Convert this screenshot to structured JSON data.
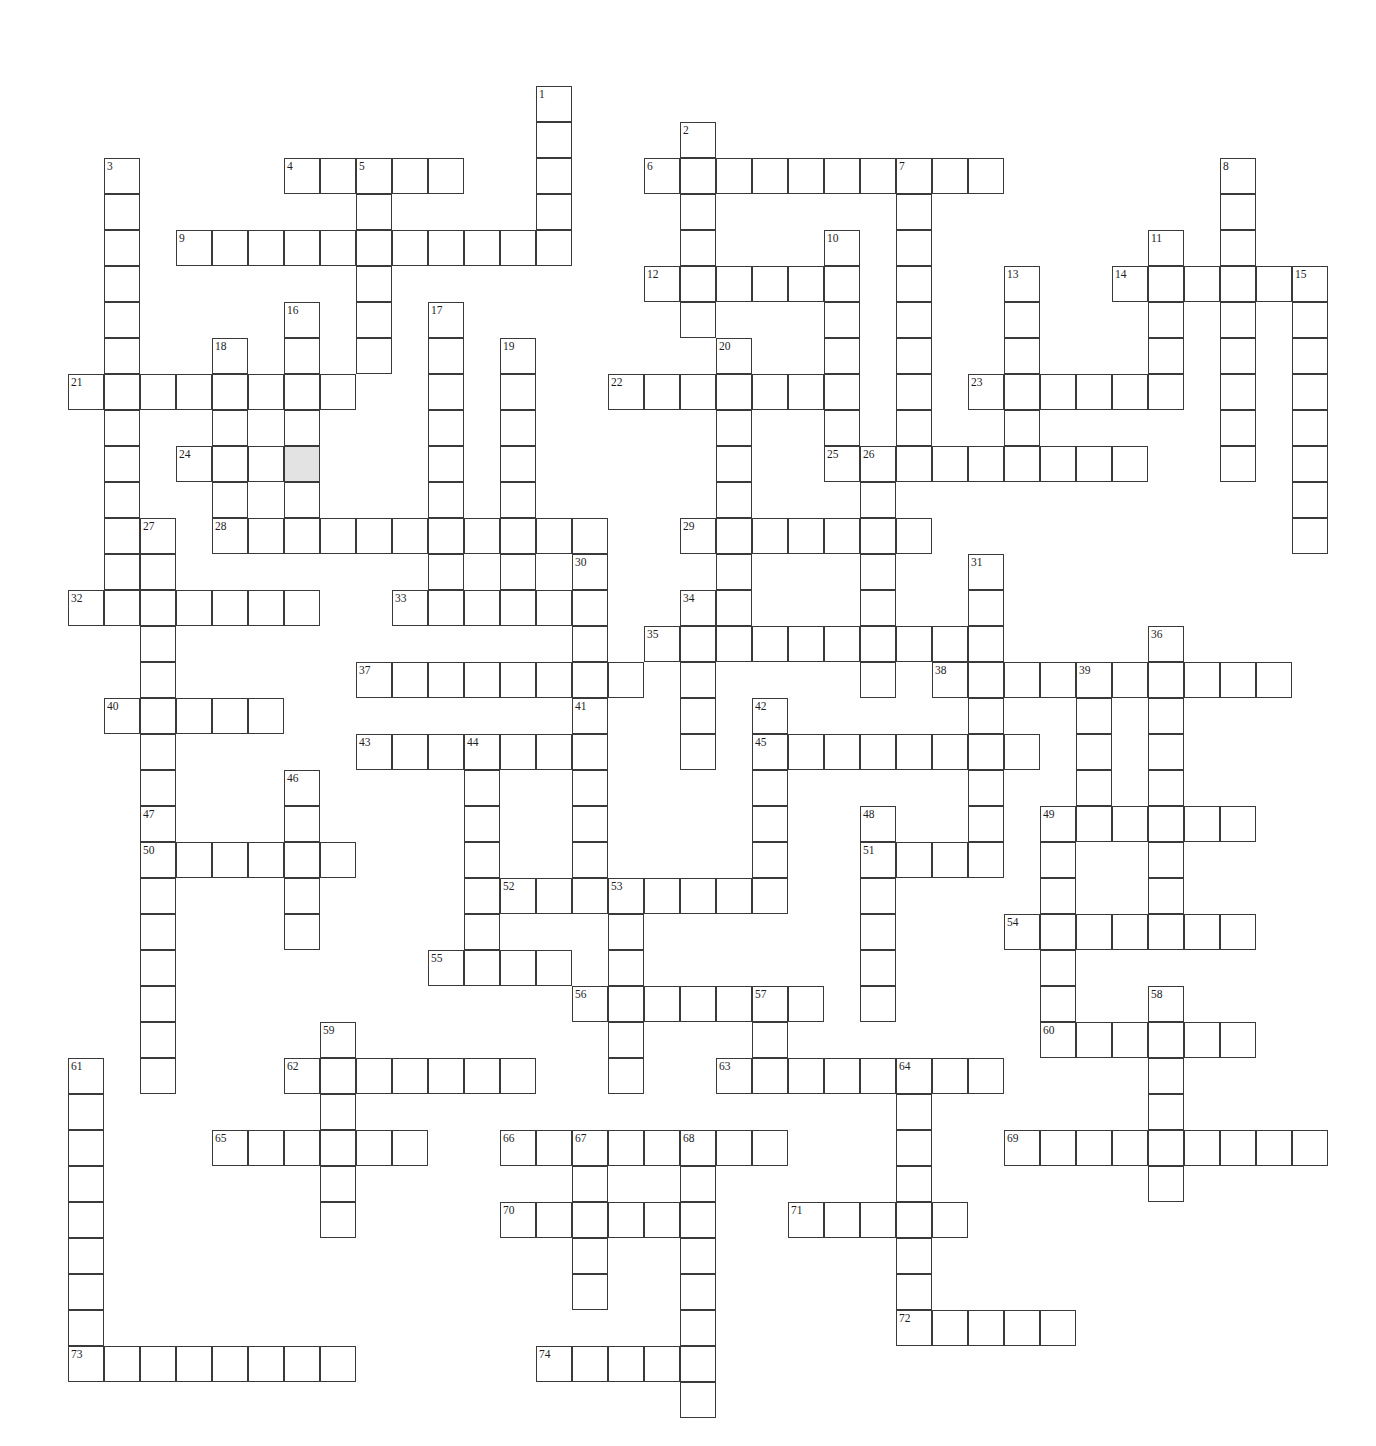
{
  "puzzle": {
    "title": "Crossword Puzzle Grid",
    "cell_size": 36,
    "origin_x": 68,
    "origin_y": 86,
    "cols": 36,
    "rows": 37,
    "grid_line_color": "#3a3a3a",
    "cell_fill_color": "#ffffff",
    "shaded_fill_color": "#e3e3e3",
    "number_color": "#1d1d1d",
    "shaded_cells": [
      [
        6,
        10
      ]
    ],
    "entries": [
      {
        "number": 1,
        "direction": "down",
        "col": 13,
        "row": 0,
        "length": 5
      },
      {
        "number": 2,
        "direction": "down",
        "col": 17,
        "row": 1,
        "length": 6
      },
      {
        "number": 3,
        "direction": "down",
        "col": 1,
        "row": 2,
        "length": 12
      },
      {
        "number": 4,
        "direction": "across",
        "col": 6,
        "row": 2,
        "length": 5
      },
      {
        "number": 5,
        "direction": "down",
        "col": 8,
        "row": 2,
        "length": 6
      },
      {
        "number": 6,
        "direction": "across",
        "col": 16,
        "row": 2,
        "length": 10
      },
      {
        "number": 7,
        "direction": "down",
        "col": 23,
        "row": 2,
        "length": 8
      },
      {
        "number": 8,
        "direction": "down",
        "col": 32,
        "row": 2,
        "length": 9
      },
      {
        "number": 9,
        "direction": "across",
        "col": 3,
        "row": 4,
        "length": 11
      },
      {
        "number": 10,
        "direction": "down",
        "col": 21,
        "row": 4,
        "length": 6
      },
      {
        "number": 11,
        "direction": "down",
        "col": 30,
        "row": 4,
        "length": 5
      },
      {
        "number": 12,
        "direction": "across",
        "col": 16,
        "row": 5,
        "length": 6
      },
      {
        "number": 13,
        "direction": "down",
        "col": 26,
        "row": 5,
        "length": 5
      },
      {
        "number": 14,
        "direction": "across",
        "col": 29,
        "row": 5,
        "length": 6
      },
      {
        "number": 15,
        "direction": "down",
        "col": 34,
        "row": 5,
        "length": 8
      },
      {
        "number": 16,
        "direction": "down",
        "col": 6,
        "row": 6,
        "length": 6
      },
      {
        "number": 17,
        "direction": "down",
        "col": 10,
        "row": 6,
        "length": 9
      },
      {
        "number": 18,
        "direction": "down",
        "col": 4,
        "row": 7,
        "length": 5
      },
      {
        "number": 19,
        "direction": "down",
        "col": 12,
        "row": 7,
        "length": 8
      },
      {
        "number": 20,
        "direction": "down",
        "col": 18,
        "row": 7,
        "length": 8
      },
      {
        "number": 21,
        "direction": "across",
        "col": 0,
        "row": 8,
        "length": 8
      },
      {
        "number": 22,
        "direction": "across",
        "col": 15,
        "row": 8,
        "length": 7
      },
      {
        "number": 23,
        "direction": "across",
        "col": 25,
        "row": 8,
        "length": 6
      },
      {
        "number": 24,
        "direction": "across",
        "col": 3,
        "row": 10,
        "length": 4
      },
      {
        "number": 25,
        "direction": "across",
        "col": 21,
        "row": 10,
        "length": 9
      },
      {
        "number": 26,
        "direction": "down",
        "col": 22,
        "row": 10,
        "length": 7
      },
      {
        "number": 27,
        "direction": "down",
        "col": 2,
        "row": 12,
        "length": 9
      },
      {
        "number": 28,
        "direction": "across",
        "col": 4,
        "row": 12,
        "length": 11
      },
      {
        "number": 29,
        "direction": "across",
        "col": 17,
        "row": 12,
        "length": 7
      },
      {
        "number": 30,
        "direction": "down",
        "col": 14,
        "row": 13,
        "length": 4
      },
      {
        "number": 31,
        "direction": "down",
        "col": 25,
        "row": 13,
        "length": 8
      },
      {
        "number": 32,
        "direction": "across",
        "col": 0,
        "row": 14,
        "length": 7
      },
      {
        "number": 33,
        "direction": "across",
        "col": 9,
        "row": 14,
        "length": 6
      },
      {
        "number": 34,
        "direction": "down",
        "col": 17,
        "row": 14,
        "length": 5
      },
      {
        "number": 35,
        "direction": "across",
        "col": 16,
        "row": 15,
        "length": 9
      },
      {
        "number": 36,
        "direction": "down",
        "col": 30,
        "row": 15,
        "length": 8
      },
      {
        "number": 37,
        "direction": "across",
        "col": 8,
        "row": 16,
        "length": 8
      },
      {
        "number": 38,
        "direction": "across",
        "col": 24,
        "row": 16,
        "length": 10
      },
      {
        "number": 39,
        "direction": "down",
        "col": 28,
        "row": 16,
        "length": 4
      },
      {
        "number": 40,
        "direction": "across",
        "col": 1,
        "row": 17,
        "length": 5
      },
      {
        "number": 41,
        "direction": "down",
        "col": 14,
        "row": 17,
        "length": 5
      },
      {
        "number": 42,
        "direction": "down",
        "col": 19,
        "row": 17,
        "length": 6
      },
      {
        "number": 43,
        "direction": "across",
        "col": 8,
        "row": 18,
        "length": 7
      },
      {
        "number": 44,
        "direction": "down",
        "col": 11,
        "row": 18,
        "length": 6
      },
      {
        "number": 45,
        "direction": "across",
        "col": 19,
        "row": 18,
        "length": 8
      },
      {
        "number": 46,
        "direction": "down",
        "col": 6,
        "row": 19,
        "length": 5
      },
      {
        "number": 47,
        "direction": "down",
        "col": 2,
        "row": 20,
        "length": 8
      },
      {
        "number": 48,
        "direction": "down",
        "col": 22,
        "row": 20,
        "length": 6
      },
      {
        "number": 49,
        "direction": "across",
        "col": 27,
        "row": 20,
        "length": 6
      },
      {
        "number": 50,
        "direction": "across",
        "col": 2,
        "row": 21,
        "length": 6
      },
      {
        "number": 51,
        "direction": "across",
        "col": 22,
        "row": 21,
        "length": 4
      },
      {
        "number": 52,
        "direction": "across",
        "col": 12,
        "row": 22,
        "length": 7
      },
      {
        "number": 53,
        "direction": "down",
        "col": 15,
        "row": 22,
        "length": 6
      },
      {
        "number": 54,
        "direction": "across",
        "col": 26,
        "row": 23,
        "length": 7
      },
      {
        "number": 55,
        "direction": "across",
        "col": 10,
        "row": 24,
        "length": 4
      },
      {
        "number": 56,
        "direction": "across",
        "col": 14,
        "row": 25,
        "length": 7
      },
      {
        "number": 57,
        "direction": "down",
        "col": 19,
        "row": 25,
        "length": 3
      },
      {
        "number": 58,
        "direction": "down",
        "col": 30,
        "row": 25,
        "length": 6
      },
      {
        "number": 59,
        "direction": "down",
        "col": 7,
        "row": 26,
        "length": 6
      },
      {
        "number": 60,
        "direction": "across",
        "col": 27,
        "row": 26,
        "length": 6
      },
      {
        "number": 61,
        "direction": "down",
        "col": 0,
        "row": 27,
        "length": 8
      },
      {
        "number": 62,
        "direction": "across",
        "col": 6,
        "row": 27,
        "length": 7
      },
      {
        "number": 63,
        "direction": "across",
        "col": 18,
        "row": 27,
        "length": 8
      },
      {
        "number": 64,
        "direction": "down",
        "col": 23,
        "row": 27,
        "length": 8
      },
      {
        "number": 65,
        "direction": "across",
        "col": 4,
        "row": 29,
        "length": 6
      },
      {
        "number": 66,
        "direction": "across",
        "col": 12,
        "row": 29,
        "length": 8
      },
      {
        "number": 67,
        "direction": "down",
        "col": 14,
        "row": 29,
        "length": 5
      },
      {
        "number": 68,
        "direction": "down",
        "col": 17,
        "row": 29,
        "length": 8
      },
      {
        "number": 69,
        "direction": "across",
        "col": 26,
        "row": 29,
        "length": 9
      },
      {
        "number": 70,
        "direction": "across",
        "col": 12,
        "row": 31,
        "length": 5
      },
      {
        "number": 71,
        "direction": "across",
        "col": 20,
        "row": 31,
        "length": 5
      },
      {
        "number": 72,
        "direction": "across",
        "col": 23,
        "row": 34,
        "length": 5
      },
      {
        "number": 73,
        "direction": "across",
        "col": 0,
        "row": 35,
        "length": 8
      },
      {
        "number": 74,
        "direction": "across",
        "col": 13,
        "row": 35,
        "length": 5
      }
    ],
    "extra_cells": [
      [
        1,
        3
      ],
      [
        1,
        4
      ],
      [
        1,
        5
      ],
      [
        1,
        6
      ],
      [
        1,
        7
      ],
      [
        1,
        8
      ],
      [
        1,
        9
      ],
      [
        1,
        10
      ],
      [
        1,
        11
      ],
      [
        1,
        12
      ],
      [
        1,
        13
      ],
      [
        13,
        1
      ],
      [
        13,
        2
      ],
      [
        13,
        3
      ],
      [
        13,
        4
      ],
      [
        17,
        2
      ],
      [
        17,
        3
      ],
      [
        17,
        4
      ],
      [
        17,
        5
      ],
      [
        17,
        6
      ],
      [
        8,
        3
      ],
      [
        8,
        4
      ],
      [
        8,
        5
      ],
      [
        8,
        6
      ],
      [
        8,
        7
      ],
      [
        23,
        3
      ],
      [
        23,
        4
      ],
      [
        23,
        5
      ],
      [
        23,
        6
      ],
      [
        23,
        7
      ],
      [
        23,
        8
      ],
      [
        23,
        9
      ],
      [
        32,
        3
      ],
      [
        32,
        4
      ],
      [
        32,
        5
      ],
      [
        32,
        6
      ],
      [
        32,
        7
      ],
      [
        32,
        8
      ],
      [
        32,
        9
      ],
      [
        32,
        10
      ],
      [
        21,
        5
      ],
      [
        21,
        6
      ],
      [
        21,
        7
      ],
      [
        21,
        8
      ],
      [
        21,
        9
      ],
      [
        30,
        5
      ],
      [
        30,
        6
      ],
      [
        30,
        7
      ],
      [
        30,
        8
      ],
      [
        26,
        6
      ],
      [
        26,
        7
      ],
      [
        26,
        8
      ],
      [
        26,
        9
      ],
      [
        34,
        6
      ],
      [
        34,
        7
      ],
      [
        34,
        8
      ],
      [
        34,
        9
      ],
      [
        34,
        10
      ],
      [
        34,
        11
      ],
      [
        34,
        12
      ],
      [
        6,
        7
      ],
      [
        6,
        8
      ],
      [
        6,
        9
      ],
      [
        6,
        10
      ],
      [
        6,
        11
      ],
      [
        10,
        7
      ],
      [
        10,
        8
      ],
      [
        10,
        9
      ],
      [
        10,
        10
      ],
      [
        10,
        11
      ],
      [
        10,
        12
      ],
      [
        10,
        13
      ],
      [
        10,
        14
      ],
      [
        4,
        8
      ],
      [
        4,
        9
      ],
      [
        4,
        10
      ],
      [
        4,
        11
      ],
      [
        12,
        8
      ],
      [
        12,
        9
      ],
      [
        12,
        10
      ],
      [
        12,
        11
      ],
      [
        12,
        12
      ],
      [
        12,
        13
      ],
      [
        12,
        14
      ],
      [
        18,
        8
      ],
      [
        18,
        9
      ],
      [
        18,
        10
      ],
      [
        18,
        11
      ],
      [
        18,
        12
      ],
      [
        18,
        13
      ],
      [
        18,
        14
      ],
      [
        22,
        11
      ],
      [
        22,
        12
      ],
      [
        22,
        13
      ],
      [
        22,
        14
      ],
      [
        22,
        15
      ],
      [
        22,
        16
      ],
      [
        2,
        13
      ],
      [
        2,
        14
      ],
      [
        2,
        15
      ],
      [
        2,
        16
      ],
      [
        2,
        17
      ],
      [
        2,
        18
      ],
      [
        2,
        19
      ],
      [
        2,
        20
      ],
      [
        14,
        14
      ],
      [
        14,
        15
      ],
      [
        14,
        16
      ],
      [
        25,
        14
      ],
      [
        25,
        15
      ],
      [
        25,
        16
      ],
      [
        25,
        17
      ],
      [
        25,
        18
      ],
      [
        25,
        19
      ],
      [
        25,
        20
      ],
      [
        17,
        15
      ],
      [
        17,
        16
      ],
      [
        17,
        17
      ],
      [
        17,
        18
      ],
      [
        30,
        16
      ],
      [
        30,
        17
      ],
      [
        30,
        18
      ],
      [
        30,
        19
      ],
      [
        30,
        20
      ],
      [
        30,
        21
      ],
      [
        30,
        22
      ],
      [
        28,
        17
      ],
      [
        28,
        18
      ],
      [
        28,
        19
      ],
      [
        14,
        18
      ],
      [
        14,
        19
      ],
      [
        14,
        20
      ],
      [
        14,
        21
      ],
      [
        19,
        18
      ],
      [
        19,
        19
      ],
      [
        19,
        20
      ],
      [
        19,
        21
      ],
      [
        19,
        22
      ],
      [
        11,
        19
      ],
      [
        11,
        20
      ],
      [
        11,
        21
      ],
      [
        11,
        22
      ],
      [
        11,
        23
      ],
      [
        6,
        20
      ],
      [
        6,
        21
      ],
      [
        6,
        22
      ],
      [
        6,
        23
      ],
      [
        2,
        21
      ],
      [
        2,
        22
      ],
      [
        2,
        23
      ],
      [
        2,
        24
      ],
      [
        2,
        25
      ],
      [
        2,
        26
      ],
      [
        2,
        27
      ],
      [
        22,
        21
      ],
      [
        22,
        22
      ],
      [
        22,
        23
      ],
      [
        22,
        24
      ],
      [
        22,
        25
      ],
      [
        27,
        21
      ],
      [
        27,
        22
      ],
      [
        27,
        23
      ],
      [
        27,
        24
      ],
      [
        27,
        25
      ],
      [
        27,
        26
      ],
      [
        15,
        23
      ],
      [
        15,
        24
      ],
      [
        15,
        25
      ],
      [
        15,
        26
      ],
      [
        15,
        27
      ],
      [
        19,
        26
      ],
      [
        19,
        27
      ],
      [
        30,
        26
      ],
      [
        30,
        27
      ],
      [
        30,
        28
      ],
      [
        30,
        29
      ],
      [
        30,
        30
      ],
      [
        7,
        27
      ],
      [
        7,
        28
      ],
      [
        7,
        29
      ],
      [
        7,
        30
      ],
      [
        7,
        31
      ],
      [
        0,
        28
      ],
      [
        0,
        29
      ],
      [
        0,
        30
      ],
      [
        0,
        31
      ],
      [
        0,
        32
      ],
      [
        0,
        33
      ],
      [
        0,
        34
      ],
      [
        23,
        28
      ],
      [
        23,
        29
      ],
      [
        23,
        30
      ],
      [
        23,
        31
      ],
      [
        23,
        32
      ],
      [
        23,
        33
      ],
      [
        23,
        34
      ],
      [
        14,
        30
      ],
      [
        14,
        31
      ],
      [
        14,
        32
      ],
      [
        14,
        33
      ],
      [
        17,
        30
      ],
      [
        17,
        31
      ],
      [
        17,
        32
      ],
      [
        17,
        33
      ],
      [
        17,
        34
      ],
      [
        17,
        35
      ],
      [
        17,
        36
      ]
    ]
  }
}
